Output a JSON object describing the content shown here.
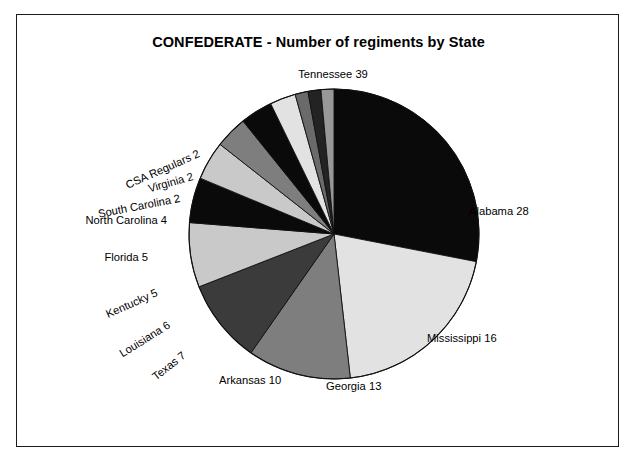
{
  "chart_data": {
    "type": "pie",
    "title": "CONFEDERATE - Number of regiments by State",
    "xlabel": "",
    "ylabel": "",
    "legend": "none",
    "grid": false,
    "total": 139,
    "start_angle_deg": 0,
    "direction": "clockwise",
    "categories": [
      "Tennessee",
      "Alabama",
      "Mississippi",
      "Georgia",
      "Arkansas",
      "Texas",
      "Louisiana",
      "Kentucky",
      "Florida",
      "North Carolina",
      "South Carolina",
      "Virginia",
      "CSA Regulars"
    ],
    "values": [
      39,
      28,
      16,
      13,
      10,
      7,
      6,
      5,
      5,
      4,
      2,
      2,
      2
    ],
    "slices": [
      {
        "name": "Tennessee",
        "value": 39,
        "label": "Tennessee 39",
        "fill": "#0a0a0a",
        "start_deg": 0.0,
        "end_deg": 101.01,
        "label_x": 316,
        "label_y": 59,
        "label_rotation": 0,
        "label_anchor": "middle"
      },
      {
        "name": "Alabama",
        "value": 28,
        "label": "Alabama 28",
        "fill": "#e2e2e2",
        "start_deg": 101.01,
        "end_deg": 173.53,
        "label_x": 452,
        "label_y": 196,
        "label_rotation": 0,
        "label_anchor": "start"
      },
      {
        "name": "Mississippi",
        "value": 16,
        "label": "Mississippi 16",
        "fill": "#7e7e7e",
        "start_deg": 173.53,
        "end_deg": 214.96,
        "label_x": 410,
        "label_y": 323,
        "label_rotation": 0,
        "label_anchor": "start"
      },
      {
        "name": "Georgia",
        "value": 13,
        "label": "Georgia 13",
        "fill": "#3b3b3b",
        "start_deg": 214.96,
        "end_deg": 248.63,
        "label_x": 309,
        "label_y": 371,
        "label_rotation": 0,
        "label_anchor": "start"
      },
      {
        "name": "Arkansas",
        "value": 10,
        "label": "Arkansas 10",
        "fill": "#c9c9c9",
        "start_deg": 248.63,
        "end_deg": 274.53,
        "label_x": 202,
        "label_y": 365,
        "label_rotation": 0,
        "label_anchor": "start"
      },
      {
        "name": "Texas",
        "value": 7,
        "label": "Texas 7",
        "fill": "#0a0a0a",
        "start_deg": 274.53,
        "end_deg": 292.66,
        "label_x": 167,
        "label_y": 339,
        "label_rotation": -38,
        "label_anchor": "end"
      },
      {
        "name": "Louisiana",
        "value": 6,
        "label": "Louisiana 6",
        "fill": "#c9c9c9",
        "start_deg": 292.66,
        "end_deg": 308.2,
        "label_x": 152,
        "label_y": 309,
        "label_rotation": -32,
        "label_anchor": "end"
      },
      {
        "name": "Kentucky",
        "value": 5,
        "label": "Kentucky 5",
        "fill": "#7e7e7e",
        "start_deg": 308.2,
        "end_deg": 321.15,
        "label_x": 140,
        "label_y": 277,
        "label_rotation": -24,
        "label_anchor": "end"
      },
      {
        "name": "Florida",
        "value": 5,
        "label": "Florida 5",
        "fill": "#0a0a0a",
        "start_deg": 321.15,
        "end_deg": 334.1,
        "label_x": 131,
        "label_y": 242,
        "label_rotation": 0,
        "label_anchor": "end"
      },
      {
        "name": "North Carolina",
        "value": 4,
        "label": "North Carolina 4",
        "fill": "#e2e2e2",
        "start_deg": 334.1,
        "end_deg": 344.46,
        "label_x": 150,
        "label_y": 205,
        "label_rotation": 0,
        "label_anchor": "end"
      },
      {
        "name": "South Carolina",
        "value": 2,
        "label": "South Carolina 2",
        "fill": "#6a6a6a",
        "start_deg": 344.46,
        "end_deg": 349.64,
        "label_x": 163,
        "label_y": 183,
        "label_rotation": -11,
        "label_anchor": "end"
      },
      {
        "name": "Virginia",
        "value": 2,
        "label": "Virginia 2",
        "fill": "#232323",
        "start_deg": 349.64,
        "end_deg": 354.82,
        "label_x": 176,
        "label_y": 161,
        "label_rotation": -16,
        "label_anchor": "end"
      },
      {
        "name": "CSA Regulars",
        "value": 2,
        "label": "CSA Regulars 2",
        "fill": "#989898",
        "start_deg": 354.82,
        "end_deg": 360.0,
        "label_x": 182,
        "label_y": 138,
        "label_rotation": -24,
        "label_anchor": "end"
      }
    ],
    "geometry": {
      "center_x": 317,
      "center_y": 219,
      "radius": 145
    },
    "style": {
      "outline_color": "#111111",
      "background": "#ffffff",
      "frame_color": "#1b1b1b"
    }
  }
}
